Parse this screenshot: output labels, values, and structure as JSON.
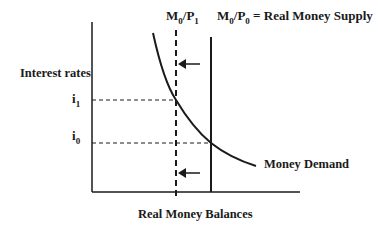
{
  "diagram": {
    "y_axis_label": "Interest rates",
    "x_axis_label": "Real Money Balances",
    "tick_i1": {
      "base": "i",
      "sub": "1"
    },
    "tick_i0": {
      "base": "i",
      "sub": "0"
    },
    "line_new": {
      "m": "M",
      "msub": "0",
      "p": "/P",
      "psub": "1"
    },
    "line_supply": {
      "m": "M",
      "msub": "0",
      "p": "/P",
      "psub": "0",
      "rest": " = Real Money Supply"
    },
    "curve_label": "Money Demand"
  }
}
